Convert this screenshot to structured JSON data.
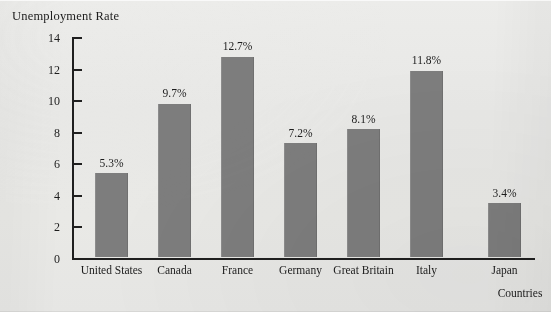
{
  "chart_data": {
    "type": "bar",
    "title": "Unemployment Rate",
    "xlabel": "Countries",
    "ylabel": "",
    "categories": [
      "United States",
      "Canada",
      "France",
      "Germany",
      "Great Britain",
      "Italy",
      "Japan"
    ],
    "values": [
      5.3,
      9.7,
      12.7,
      7.2,
      8.1,
      11.8,
      3.4
    ],
    "value_labels": [
      "5.3%",
      "9.7%",
      "12.7%",
      "7.2%",
      "8.1%",
      "11.8%",
      "3.4%"
    ],
    "ylim": [
      0,
      14
    ],
    "ytick_labels": [
      "0",
      "2",
      "4",
      "6",
      "8",
      "10",
      "12",
      "14"
    ],
    "yticks": [
      0,
      2,
      4,
      6,
      8,
      10,
      12,
      14
    ],
    "grid": false,
    "legend": "none",
    "bar_color": "#7d7d7d",
    "axis_color": "#1f1f1f",
    "background_color": "#e9e9e7",
    "text_color": "#1c1c1c"
  }
}
